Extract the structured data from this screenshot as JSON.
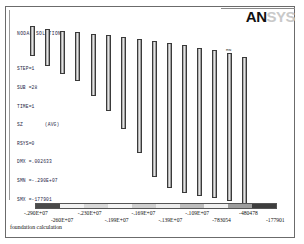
{
  "window": {
    "logo_primary": "AN",
    "logo_secondary": "SYS",
    "footer": "foundation calculation"
  },
  "header": {
    "title": "NODAL SOLUTION",
    "lines": [
      "STEP=1",
      "SUB =28",
      "TIME=1",
      "SZ",
      "RSYS=0",
      "DMX =.002633",
      "SMN =-.290E+07",
      "SMX =-177901"
    ],
    "component_note": "(AVG)"
  },
  "annotations": {
    "mn_marker": "MN"
  },
  "chart_data": {
    "type": "bar",
    "title": "NODAL SOLUTION",
    "subtitle": "SZ (AVG)",
    "xlabel": "",
    "ylabel": "",
    "legend_position": "bottom",
    "grid": false,
    "colorbar": {
      "label": "SZ stress (Pa)",
      "min": -2900000,
      "max": -177901,
      "tick_labels": [
        "-.290E+07",
        "-260E+07",
        "-.230E+07",
        "-.199E+07",
        "-.169E+07",
        "-.139E+07",
        "-.109E+07",
        "-783054",
        "-480478",
        "-177901"
      ],
      "segment_colors": [
        "#4a4a4a",
        "#f2f2f2",
        "#d8d8d8",
        "#f4f4f4",
        "#cfcfcf",
        "#ececec",
        "#bdbdbd",
        "#f0f0f0",
        "#9e9e9e",
        "#3d3d3d"
      ]
    },
    "categories": [
      "P1",
      "P2",
      "P3",
      "P4",
      "P5",
      "P6",
      "P7",
      "P8",
      "P9",
      "P10",
      "P11",
      "P12",
      "P13",
      "P14",
      "P15"
    ],
    "values": [
      30,
      37,
      43,
      49,
      62,
      76,
      92,
      114,
      136,
      155,
      165,
      170,
      172,
      173,
      174
    ],
    "bars": [
      {
        "name": "P1",
        "x": 0,
        "top": 0,
        "height": 30,
        "width": 5
      },
      {
        "name": "P2",
        "x": 15,
        "top": 3,
        "height": 37,
        "width": 5
      },
      {
        "name": "P3",
        "x": 30,
        "top": 5,
        "height": 43,
        "width": 5
      },
      {
        "name": "P4",
        "x": 45,
        "top": 6,
        "height": 49,
        "width": 5
      },
      {
        "name": "P5",
        "x": 61,
        "top": 8,
        "height": 62,
        "width": 5
      },
      {
        "name": "P6",
        "x": 76,
        "top": 9,
        "height": 76,
        "width": 5
      },
      {
        "name": "P7",
        "x": 91,
        "top": 11,
        "height": 92,
        "width": 5
      },
      {
        "name": "P8",
        "x": 107,
        "top": 13,
        "height": 114,
        "width": 5
      },
      {
        "name": "P9",
        "x": 122,
        "top": 15,
        "height": 136,
        "width": 5
      },
      {
        "name": "P10",
        "x": 137,
        "top": 17,
        "height": 145,
        "width": 5
      },
      {
        "name": "P11",
        "x": 152,
        "top": 19,
        "height": 148,
        "width": 5
      },
      {
        "name": "P12",
        "x": 167,
        "top": 22,
        "height": 148,
        "width": 5
      },
      {
        "name": "P13",
        "x": 182,
        "top": 24,
        "height": 148,
        "width": 5
      },
      {
        "name": "P14",
        "x": 197,
        "top": 27,
        "height": 148,
        "width": 5
      },
      {
        "name": "P15",
        "x": 212,
        "top": 31,
        "height": 148,
        "width": 5
      }
    ]
  }
}
